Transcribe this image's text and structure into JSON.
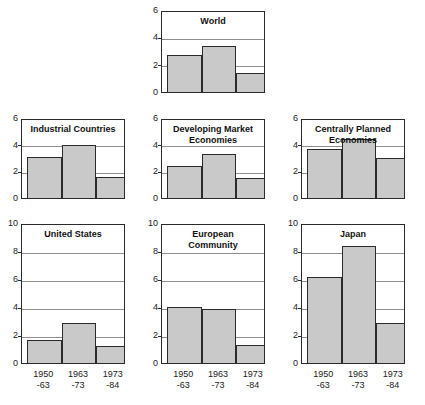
{
  "figure": {
    "suptitle": "",
    "bar_color": "#c9c9c9",
    "bar_edge_color": "#2b2b2b",
    "grid_color": "#8d8d8d",
    "axis_color": "#2b2b2b",
    "background": "#ffffff"
  },
  "chart_data": {
    "type": "bar",
    "title": "",
    "xlabel": "",
    "ylabel": "",
    "grid": true,
    "legend": "none",
    "categories": [
      "1950\n-63",
      "1963\n-73",
      "1973\n-84"
    ],
    "category_labels": [
      {
        "line1": "1950",
        "line2": "-63"
      },
      {
        "line1": "1963",
        "line2": "-73"
      },
      {
        "line1": "1973",
        "line2": "-84"
      }
    ],
    "panels": [
      {
        "name": "World",
        "title": "World",
        "title_lines": [
          "World"
        ],
        "row": 0,
        "col": 1,
        "ylim": [
          0,
          6
        ],
        "yticks": [
          0,
          2,
          4,
          6
        ],
        "values": [
          2.7,
          3.4,
          1.4
        ]
      },
      {
        "name": "Industrial Countries",
        "title": "Industrial Countries",
        "title_lines": [
          "Industrial Countries"
        ],
        "row": 1,
        "col": 0,
        "ylim": [
          0,
          6
        ],
        "yticks": [
          0,
          2,
          4,
          6
        ],
        "values": [
          3.1,
          4.0,
          1.6
        ]
      },
      {
        "name": "Developing Market Economies",
        "title": "Developing Market Economies",
        "title_lines": [
          "Developing Market",
          "Economies"
        ],
        "row": 1,
        "col": 1,
        "ylim": [
          0,
          6
        ],
        "yticks": [
          0,
          2,
          4,
          6
        ],
        "values": [
          2.4,
          3.3,
          1.5
        ]
      },
      {
        "name": "Centrally Planned Economies",
        "title": "Centrally Planned Economies",
        "title_lines": [
          "Centrally Planned",
          "Economies"
        ],
        "row": 1,
        "col": 2,
        "ylim": [
          0,
          6
        ],
        "yticks": [
          0,
          2,
          4,
          6
        ],
        "values": [
          3.7,
          4.4,
          3.0
        ]
      },
      {
        "name": "United States",
        "title": "United States",
        "title_lines": [
          "United States"
        ],
        "row": 2,
        "col": 0,
        "ylim": [
          0,
          10
        ],
        "yticks": [
          0,
          2,
          4,
          6,
          8,
          10
        ],
        "values": [
          1.65,
          2.85,
          1.25
        ]
      },
      {
        "name": "European Community",
        "title": "European Community",
        "title_lines": [
          "European",
          "Community"
        ],
        "row": 2,
        "col": 1,
        "ylim": [
          0,
          10
        ],
        "yticks": [
          0,
          2,
          4,
          6,
          8,
          10
        ],
        "values": [
          4.0,
          3.85,
          1.3
        ]
      },
      {
        "name": "Japan",
        "title": "Japan",
        "title_lines": [
          "Japan"
        ],
        "row": 2,
        "col": 2,
        "ylim": [
          0,
          10
        ],
        "yticks": [
          0,
          2,
          4,
          6,
          8,
          10
        ],
        "values": [
          6.15,
          8.35,
          2.85
        ]
      }
    ]
  }
}
